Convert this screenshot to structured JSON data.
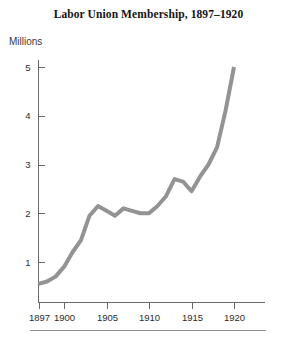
{
  "chart_data": {
    "type": "line",
    "title": "Labor Union Membership, 1897–1920",
    "xlabel": "",
    "ylabel": "Millions",
    "xlim": [
      1897,
      1920
    ],
    "ylim": [
      0,
      5.2
    ],
    "grid": false,
    "legend": false,
    "line_color": "#939393",
    "x": [
      1897,
      1898,
      1899,
      1900,
      1901,
      1902,
      1903,
      1904,
      1905,
      1906,
      1907,
      1908,
      1909,
      1910,
      1911,
      1912,
      1913,
      1914,
      1915,
      1916,
      1917,
      1918,
      1919,
      1920
    ],
    "values": [
      0.55,
      0.6,
      0.7,
      0.9,
      1.2,
      1.45,
      1.95,
      2.15,
      2.05,
      1.95,
      2.1,
      2.05,
      2.0,
      2.0,
      2.15,
      2.35,
      2.7,
      2.65,
      2.45,
      2.75,
      3.0,
      3.35,
      4.1,
      5.0
    ],
    "x_tick_values": [
      1897,
      1900,
      1905,
      1910,
      1915,
      1920
    ],
    "x_tick_labels": [
      "1897",
      "1900",
      "1905",
      "1910",
      "1915",
      "1920"
    ],
    "y_tick_values": [
      1,
      2,
      3,
      4,
      5
    ],
    "y_tick_labels": [
      "1",
      "2",
      "3",
      "4",
      "5"
    ]
  },
  "figure": {
    "title": "Labor Union Membership, 1897–1920",
    "y_axis_caption": "Millions"
  }
}
